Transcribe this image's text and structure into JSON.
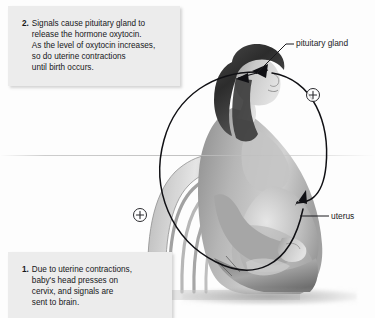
{
  "figure": {
    "background_color": "#fdfdfd",
    "illustration": {
      "subject": "seated pregnant woman in profile holding her abdomen",
      "style": "grayscale medical illustration",
      "chair": "wooden slat-back chair"
    }
  },
  "captions": [
    {
      "number": "2.",
      "lines": [
        "Signals cause pituitary gland to",
        "release the hormone oxytocin.",
        "As the level of oxytocin increases,",
        "so do uterine contractions",
        "until birth occurs."
      ],
      "background_color": "#ececec",
      "text_color": "#17171a"
    },
    {
      "number": "1.",
      "lines": [
        "Due to uterine contractions,",
        "baby's head presses on",
        "cervix, and signals are",
        "sent to brain."
      ],
      "background_color": "#ececec",
      "text_color": "#17171a"
    }
  ],
  "leader_labels": [
    {
      "text": "pituitary gland",
      "target": "head / pituitary"
    },
    {
      "text": "uterus",
      "target": "abdomen / uterus"
    }
  ],
  "feedback_markers": [
    {
      "symbol": "+",
      "position": "upper-right of loop"
    },
    {
      "symbol": "+",
      "position": "lower-left of loop"
    }
  ],
  "loop": {
    "description": "circular positive-feedback arrow encircling the figure",
    "stroke_color": "#101014",
    "arrowheads": 2
  }
}
